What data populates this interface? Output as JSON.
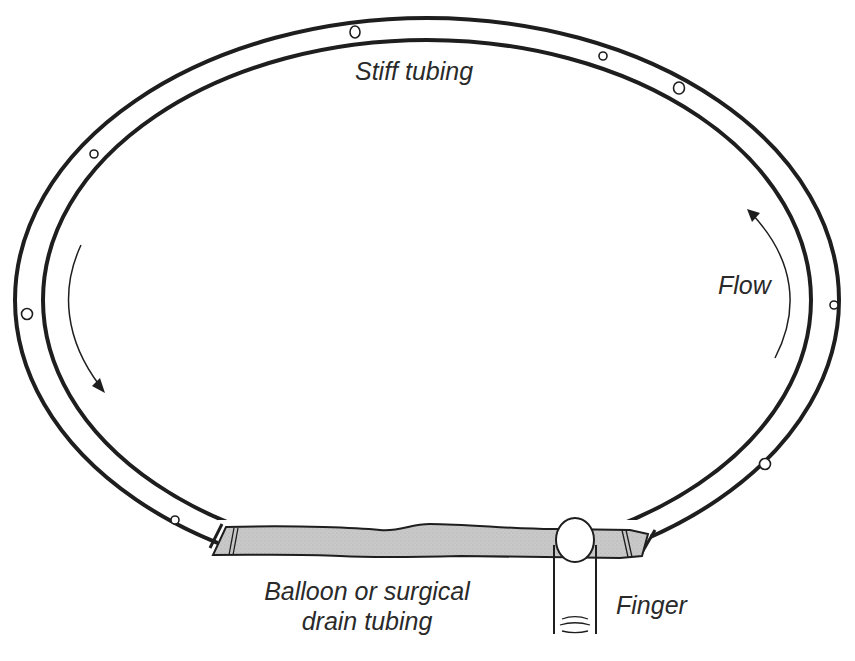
{
  "diagram": {
    "labels": {
      "stiff_tubing": "Stiff tubing",
      "flow": "Flow",
      "balloon_line1": "Balloon or surgical",
      "balloon_line2": "drain tubing",
      "finger": "Finger"
    },
    "colors": {
      "line": "#1e1e1e",
      "tubing_fill": "#c8c8c8",
      "background": "#ffffff"
    }
  }
}
